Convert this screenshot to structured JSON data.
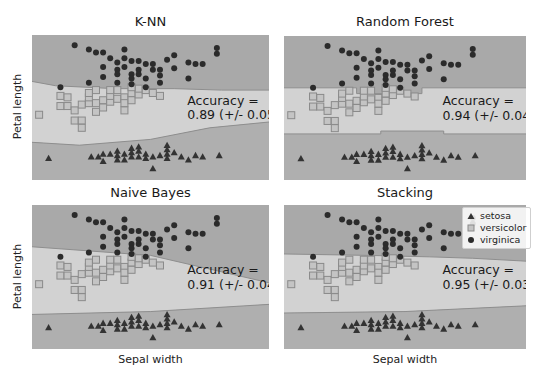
{
  "figure": {
    "xlabel": "Sepal width",
    "ylabel": "Petal length",
    "colors": {
      "region_virginica": "#a9a9a9",
      "region_versicolor": "#d2d2d2",
      "region_setosa": "#afafaf",
      "boundary": "#8e8e8e",
      "marker_setosa": "#333333",
      "marker_versicolor_edge": "#8a8a8a",
      "marker_versicolor_fill": "#c4c4c4",
      "marker_virginica": "#2b2b2b"
    }
  },
  "legend": {
    "entries": [
      {
        "label": "setosa",
        "marker": "triangle-icon"
      },
      {
        "label": "versicolor",
        "marker": "square-icon"
      },
      {
        "label": "virginica",
        "marker": "circle-icon"
      }
    ]
  },
  "panels": [
    {
      "title": "K-NN",
      "accuracy_label": "Accuracy =",
      "accuracy_value": "0.89 (+/- 0.05)"
    },
    {
      "title": "Random Forest",
      "accuracy_label": "Accuracy =",
      "accuracy_value": "0.94 (+/- 0.04)"
    },
    {
      "title": "Naive Bayes",
      "accuracy_label": "Accuracy =",
      "accuracy_value": "0.91 (+/- 0.04)"
    },
    {
      "title": "Stacking",
      "accuracy_label": "Accuracy =",
      "accuracy_value": "0.95 (+/- 0.03)"
    }
  ],
  "chart_data": [
    {
      "type": "scatter",
      "title": "K-NN",
      "xlabel": "",
      "ylabel": "Petal length",
      "annotation": "Accuracy = 0.89 (+/- 0.05)",
      "grid": false,
      "legend_position": "none",
      "decision_regions": {
        "upper_boundary": [
          [
            0,
            0.32
          ],
          [
            0.1,
            0.35
          ],
          [
            0.35,
            0.37
          ],
          [
            0.6,
            0.37
          ],
          [
            0.8,
            0.38
          ],
          [
            1,
            0.38
          ]
        ],
        "lower_boundary": [
          [
            0,
            0.74
          ],
          [
            0.2,
            0.76
          ],
          [
            0.5,
            0.72
          ],
          [
            0.75,
            0.64
          ],
          [
            1,
            0.6
          ]
        ]
      }
    },
    {
      "type": "scatter",
      "title": "Random Forest",
      "xlabel": "",
      "ylabel": "",
      "annotation": "Accuracy = 0.94 (+/- 0.04)",
      "grid": false,
      "legend_position": "none",
      "decision_regions": {
        "upper_boundary": [
          [
            0,
            0.36
          ],
          [
            0.3,
            0.36
          ],
          [
            0.3,
            0.4
          ],
          [
            0.57,
            0.4
          ],
          [
            0.57,
            0.36
          ],
          [
            1,
            0.36
          ]
        ],
        "lower_boundary": [
          [
            0,
            0.68
          ],
          [
            0.4,
            0.68
          ],
          [
            0.4,
            0.66
          ],
          [
            0.66,
            0.66
          ],
          [
            0.66,
            0.68
          ],
          [
            1,
            0.68
          ]
        ]
      }
    },
    {
      "type": "scatter",
      "title": "Naive Bayes",
      "xlabel": "Sepal width",
      "ylabel": "Petal length",
      "annotation": "Accuracy = 0.91 (+/- 0.04)",
      "grid": false,
      "legend_position": "none",
      "decision_regions": {
        "upper_boundary": [
          [
            0,
            0.29
          ],
          [
            0.5,
            0.35
          ],
          [
            1,
            0.54
          ]
        ],
        "lower_boundary": [
          [
            0,
            0.76
          ],
          [
            0.5,
            0.74
          ],
          [
            1,
            0.69
          ]
        ]
      }
    },
    {
      "type": "scatter",
      "title": "Stacking",
      "xlabel": "Sepal width",
      "ylabel": "",
      "annotation": "Accuracy = 0.95 (+/- 0.03)",
      "grid": false,
      "legend_position": "upper right",
      "legend": [
        "setosa",
        "versicolor",
        "virginica"
      ],
      "decision_regions": {
        "upper_boundary": [
          [
            0,
            0.34
          ],
          [
            0.35,
            0.35
          ],
          [
            0.6,
            0.36
          ],
          [
            0.78,
            0.37
          ],
          [
            1,
            0.39
          ]
        ],
        "lower_boundary": [
          [
            0,
            0.75
          ],
          [
            0.5,
            0.74
          ],
          [
            1,
            0.7
          ]
        ]
      }
    }
  ],
  "scatter_points": {
    "note_coords": "normalized within plot area: x 0..1 left-to-right, y 0..1 top-to-bottom",
    "setosa": [
      [
        0.07,
        0.85
      ],
      [
        0.25,
        0.84
      ],
      [
        0.28,
        0.84
      ],
      [
        0.3,
        0.82
      ],
      [
        0.3,
        0.87
      ],
      [
        0.33,
        0.82
      ],
      [
        0.36,
        0.83
      ],
      [
        0.36,
        0.86
      ],
      [
        0.39,
        0.82
      ],
      [
        0.39,
        0.86
      ],
      [
        0.42,
        0.81
      ],
      [
        0.42,
        0.84
      ],
      [
        0.42,
        0.78
      ],
      [
        0.45,
        0.8
      ],
      [
        0.45,
        0.84
      ],
      [
        0.48,
        0.82
      ],
      [
        0.48,
        0.85
      ],
      [
        0.51,
        0.84
      ],
      [
        0.51,
        0.92
      ],
      [
        0.54,
        0.83
      ],
      [
        0.57,
        0.82
      ],
      [
        0.57,
        0.79
      ],
      [
        0.57,
        0.85
      ],
      [
        0.6,
        0.81
      ],
      [
        0.63,
        0.84
      ],
      [
        0.66,
        0.86
      ],
      [
        0.69,
        0.83
      ],
      [
        0.72,
        0.84
      ],
      [
        0.79,
        0.83
      ],
      [
        0.36,
        0.8
      ],
      [
        0.45,
        0.77
      ],
      [
        0.57,
        0.76
      ]
    ],
    "versicolor": [
      [
        0.03,
        0.55
      ],
      [
        0.12,
        0.42
      ],
      [
        0.15,
        0.43
      ],
      [
        0.12,
        0.49
      ],
      [
        0.15,
        0.49
      ],
      [
        0.18,
        0.52
      ],
      [
        0.18,
        0.59
      ],
      [
        0.21,
        0.59
      ],
      [
        0.21,
        0.48
      ],
      [
        0.24,
        0.47
      ],
      [
        0.24,
        0.43
      ],
      [
        0.24,
        0.4
      ],
      [
        0.27,
        0.47
      ],
      [
        0.27,
        0.53
      ],
      [
        0.3,
        0.45
      ],
      [
        0.3,
        0.5
      ],
      [
        0.33,
        0.46
      ],
      [
        0.33,
        0.42
      ],
      [
        0.36,
        0.44
      ],
      [
        0.36,
        0.38
      ],
      [
        0.39,
        0.43
      ],
      [
        0.39,
        0.47
      ],
      [
        0.39,
        0.52
      ],
      [
        0.42,
        0.4
      ],
      [
        0.42,
        0.45
      ],
      [
        0.45,
        0.41
      ],
      [
        0.45,
        0.37
      ],
      [
        0.48,
        0.38
      ],
      [
        0.51,
        0.4
      ],
      [
        0.54,
        0.42
      ],
      [
        0.21,
        0.64
      ],
      [
        0.27,
        0.38
      ],
      [
        0.33,
        0.38
      ],
      [
        0.42,
        0.36
      ]
    ],
    "virginica": [
      [
        0.18,
        0.07
      ],
      [
        0.24,
        0.1
      ],
      [
        0.27,
        0.12
      ],
      [
        0.3,
        0.12
      ],
      [
        0.3,
        0.22
      ],
      [
        0.33,
        0.16
      ],
      [
        0.36,
        0.19
      ],
      [
        0.36,
        0.24
      ],
      [
        0.36,
        0.27
      ],
      [
        0.39,
        0.1
      ],
      [
        0.39,
        0.16
      ],
      [
        0.39,
        0.22
      ],
      [
        0.42,
        0.18
      ],
      [
        0.42,
        0.27
      ],
      [
        0.42,
        0.3
      ],
      [
        0.42,
        0.34
      ],
      [
        0.45,
        0.18
      ],
      [
        0.45,
        0.24
      ],
      [
        0.45,
        0.27
      ],
      [
        0.48,
        0.2
      ],
      [
        0.48,
        0.3
      ],
      [
        0.51,
        0.2
      ],
      [
        0.51,
        0.24
      ],
      [
        0.54,
        0.28
      ],
      [
        0.54,
        0.33
      ],
      [
        0.57,
        0.17
      ],
      [
        0.6,
        0.23
      ],
      [
        0.66,
        0.19
      ],
      [
        0.66,
        0.3
      ],
      [
        0.69,
        0.2
      ],
      [
        0.72,
        0.2
      ],
      [
        0.78,
        0.09
      ],
      [
        0.78,
        0.13
      ],
      [
        0.6,
        0.14
      ],
      [
        0.12,
        0.36
      ],
      [
        0.24,
        0.33
      ],
      [
        0.3,
        0.29
      ],
      [
        0.36,
        0.33
      ],
      [
        0.48,
        0.36
      ],
      [
        0.54,
        0.24
      ]
    ]
  }
}
